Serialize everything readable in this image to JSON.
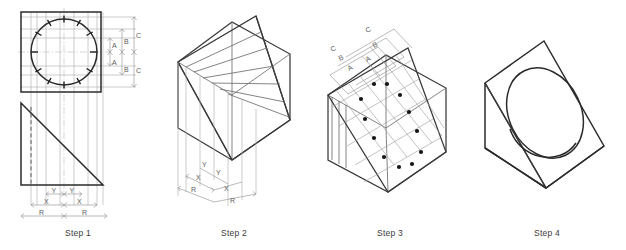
{
  "figure": {
    "background_color": "#ffffff",
    "line_color": "#2b2b2b",
    "construction_line_color": "#b2b2b2"
  },
  "steps": [
    {
      "id": "step-1",
      "caption": "Step 1",
      "description": "Orthographic views: top view square with inscribed circle divided into twelve points, front view right triangle",
      "views": [
        "top-view-square-with-circle",
        "front-view-right-triangle"
      ],
      "circle_divisions": 12,
      "vertical_dimensions": {
        "upper": [
          "A",
          "B",
          "C"
        ],
        "lower": [
          "A",
          "B",
          "C"
        ]
      },
      "horizontal_dimensions": {
        "row_1": [
          "Y",
          "Y"
        ],
        "row_2": [
          "X",
          "X"
        ],
        "row_3": [
          "R",
          "R"
        ]
      }
    },
    {
      "id": "step-2",
      "caption": "Step 2",
      "description": "Isometric cube with inclined cutting plane and transferred width ordinates",
      "horizontal_dimensions": {
        "row_1": [
          "Y",
          "Y"
        ],
        "row_2": [
          "X",
          "X"
        ],
        "row_3": [
          "R",
          "R"
        ]
      }
    },
    {
      "id": "step-3",
      "caption": "Step 3",
      "description": "Grid laid out on the inclined face with twelve plotted ellipse points",
      "plotted_points": 12,
      "ordinate_dimensions": {
        "inner": [
          "A",
          "A"
        ],
        "middle": [
          "B",
          "B"
        ],
        "outer": [
          "C",
          "C"
        ]
      }
    },
    {
      "id": "step-4",
      "caption": "Step 4",
      "description": "Completed wedge with finished elliptical hole through the inclined face"
    }
  ]
}
